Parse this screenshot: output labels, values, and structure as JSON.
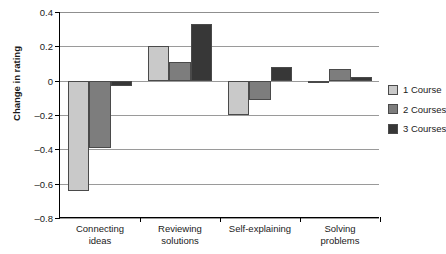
{
  "chart_data": {
    "type": "bar",
    "title": "",
    "xlabel": "",
    "ylabel": "Change in rating",
    "categories": [
      "Connecting ideas",
      "Reviewing solutions",
      "Self-explaining",
      "Solving problems"
    ],
    "category_labels_multiline": [
      "Connecting\nideas",
      "Reviewing\nsolutions",
      "Self-explaining",
      "Solving\nproblems"
    ],
    "series": [
      {
        "name": "1 Course",
        "color": "#c9c9c9",
        "values": [
          -0.64,
          0.2,
          -0.2,
          0.0
        ]
      },
      {
        "name": "2 Courses",
        "color": "#7d7d7d",
        "values": [
          -0.39,
          0.11,
          -0.11,
          0.07
        ]
      },
      {
        "name": "3 Courses",
        "color": "#373737",
        "values": [
          -0.03,
          0.33,
          0.08,
          0.02
        ]
      }
    ],
    "ylim": [
      -0.8,
      0.4
    ],
    "yticks": [
      0.4,
      0.2,
      0,
      -0.2,
      -0.4,
      -0.6,
      -0.8
    ],
    "ytick_labels": [
      "0.4",
      "0.2",
      "0",
      "–0.2",
      "–0.4",
      "–0.6",
      "–0.8"
    ],
    "grid": true,
    "grid_axis": "y",
    "legend_position": "right"
  },
  "legend": {
    "items": [
      {
        "label": "1 Course",
        "color": "#c9c9c9"
      },
      {
        "label": "2 Courses",
        "color": "#7d7d7d"
      },
      {
        "label": "3 Courses",
        "color": "#373737"
      }
    ]
  }
}
